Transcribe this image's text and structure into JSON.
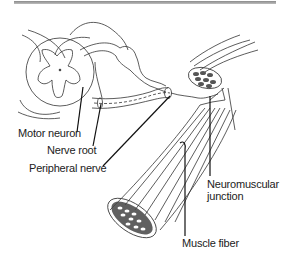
{
  "figure": {
    "labels": {
      "motor_neuron": "Motor neuron",
      "nerve_root": "Nerve root",
      "peripheral_nerve": "Peripheral nerve",
      "neuromuscular_junction_line1": "Neuromuscular",
      "neuromuscular_junction_line2": "junction",
      "muscle_fiber": "Muscle fiber"
    },
    "colors": {
      "ink": "#222222",
      "rule": "#9a9a9a",
      "background": "#ffffff"
    }
  }
}
